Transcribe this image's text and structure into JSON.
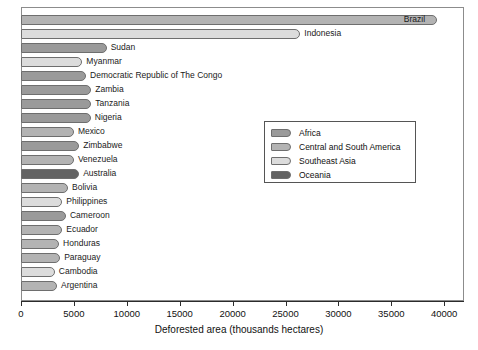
{
  "chart_data": {
    "type": "bar",
    "orientation": "horizontal",
    "title": "",
    "xlabel": "Deforested area (thousands hectares)",
    "ylabel": "",
    "xlim": [
      0,
      42000
    ],
    "xticks": [
      0,
      5000,
      10000,
      15000,
      20000,
      25000,
      30000,
      35000,
      40000
    ],
    "xticklabels": [
      "0",
      "5000",
      "10000",
      "15000",
      "20000",
      "25000",
      "30000",
      "35000",
      "40000"
    ],
    "grid": false,
    "legend_position": "center-right",
    "categories": [
      "Brazil",
      "Indonesia",
      "Sudan",
      "Myanmar",
      "Democratic Republic of The Congo",
      "Zambia",
      "Tanzania",
      "Nigeria",
      "Mexico",
      "Zimbabwe",
      "Venezuela",
      "Australia",
      "Bolivia",
      "Philippines",
      "Cameroon",
      "Ecuador",
      "Honduras",
      "Paraguay",
      "Cambodia",
      "Argentina"
    ],
    "values": [
      39300,
      26400,
      8100,
      5800,
      6150,
      6650,
      6650,
      6600,
      5000,
      5500,
      5000,
      5500,
      4450,
      3900,
      4250,
      3900,
      3600,
      3700,
      3200,
      3400
    ],
    "groups": [
      "Central and South America",
      "Southeast Asia",
      "Africa",
      "Southeast Asia",
      "Africa",
      "Africa",
      "Africa",
      "Africa",
      "Central and South America",
      "Africa",
      "Central and South America",
      "Oceania",
      "Central and South America",
      "Southeast Asia",
      "Africa",
      "Central and South America",
      "Central and South America",
      "Central and South America",
      "Southeast Asia",
      "Central and South America"
    ]
  },
  "legend": {
    "items": [
      {
        "label": "Africa",
        "color": "#9a9a9a"
      },
      {
        "label": "Central and South America",
        "color": "#b3b3b3"
      },
      {
        "label": "Southeast Asia",
        "color": "#dcdcdc"
      },
      {
        "label": "Oceania",
        "color": "#636363"
      }
    ]
  },
  "colors": {
    "Africa": "#9a9a9a",
    "Central and South America": "#b3b3b3",
    "Southeast Asia": "#dcdcdc",
    "Oceania": "#636363",
    "axis": "#2b2b2b",
    "frame": "#8c8c8c",
    "bar_edge": "#6e6e6e",
    "background": "#ffffff"
  }
}
